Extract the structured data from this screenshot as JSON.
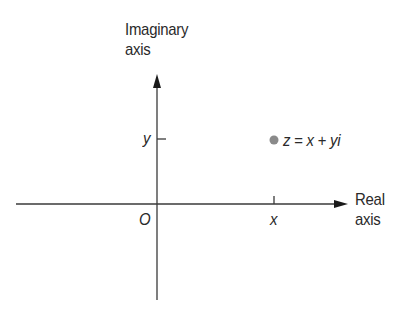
{
  "diagram": {
    "imaginary_axis_label": [
      "Imaginary",
      "axis"
    ],
    "real_axis_label": [
      "Real",
      "axis"
    ],
    "origin_label": "O",
    "x_tick_label": "x",
    "y_tick_label": "y",
    "point_label": "z = x + yi",
    "point_color": "#8a8a8a",
    "axis_color": "#3a3a3a"
  }
}
